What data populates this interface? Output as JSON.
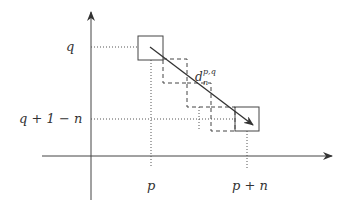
{
  "diagram": {
    "labels": {
      "y_tick_q": "q",
      "y_tick_q1n": "q + 1 − n",
      "x_tick_p": "p",
      "x_tick_pn": "p + n",
      "arrow_label_base": "d",
      "arrow_label_sup": "p,q",
      "arrow_label_sub": "n"
    },
    "colors": {
      "line": "#444444",
      "dotted": "#555555",
      "background": "#ffffff"
    },
    "geometry": {
      "origin": [
        91,
        156
      ],
      "y_axis_top": 10,
      "x_axis_left": 42,
      "x_axis_right": 332,
      "start_square": [
        138,
        36,
        25,
        24
      ],
      "end_square": [
        235,
        107,
        24,
        24
      ],
      "dashed_squares": [
        [
          163,
          59,
          24,
          24
        ],
        [
          187,
          83,
          24,
          24
        ],
        [
          211,
          107,
          24,
          24
        ]
      ]
    }
  }
}
